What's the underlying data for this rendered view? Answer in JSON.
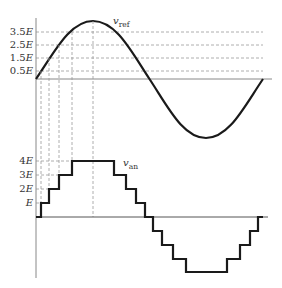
{
  "top_plot": {
    "signal_label": "v",
    "signal_subscript": "ref",
    "levels": [
      {
        "label_num": "3.5",
        "label_var": "E",
        "y": 32
      },
      {
        "label_num": "2.5",
        "label_var": "E",
        "y": 45
      },
      {
        "label_num": "1.5",
        "label_var": "E",
        "y": 58
      },
      {
        "label_num": "0.5",
        "label_var": "E",
        "y": 71
      }
    ]
  },
  "bottom_plot": {
    "signal_label": "v",
    "signal_subscript": "an",
    "levels": [
      {
        "label_num": "4",
        "label_var": "E",
        "y": 161
      },
      {
        "label_num": "3",
        "label_var": "E",
        "y": 175
      },
      {
        "label_num": "2",
        "label_var": "E",
        "y": 189
      },
      {
        "label_num": "",
        "label_var": "E",
        "y": 203
      }
    ]
  },
  "colors": {
    "curve": "#1a1a1a",
    "axis": "#888888",
    "dashed": "#999999",
    "text": "#333333"
  }
}
